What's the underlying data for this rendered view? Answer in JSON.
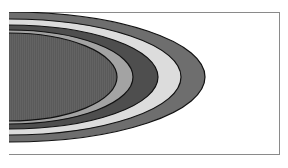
{
  "diagram": {
    "center": {
      "x": 9,
      "y": 77
    },
    "bands": [
      {
        "name": "band-outer",
        "rx": 196,
        "ry": 65,
        "color": "#6e6e6e"
      },
      {
        "name": "band-very-light",
        "rx": 172,
        "ry": 58,
        "color": "#dcdcdc"
      },
      {
        "name": "band-dark",
        "rx": 149,
        "ry": 52,
        "color": "#4e4e4e"
      },
      {
        "name": "band-light-gray",
        "rx": 124,
        "ry": 47,
        "color": "#a3a3a3"
      },
      {
        "name": "band-core",
        "rx": 108,
        "ry": 44,
        "color": "#5a5a5a"
      }
    ],
    "outline_color": "#111111",
    "frame_color": "#8a8a8a"
  }
}
